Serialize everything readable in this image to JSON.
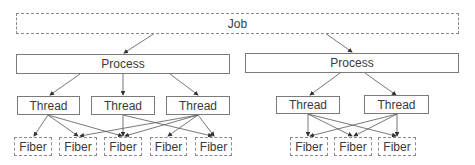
{
  "diagram": {
    "job": {
      "label": "Job"
    },
    "processes": [
      {
        "label": "Process"
      },
      {
        "label": "Process"
      }
    ],
    "threads": [
      {
        "label": "Thread",
        "process": 0
      },
      {
        "label": "Thread",
        "process": 0
      },
      {
        "label": "Thread",
        "process": 0
      },
      {
        "label": "Thread",
        "process": 1
      },
      {
        "label": "Thread",
        "process": 1
      }
    ],
    "fibers": [
      {
        "label": "Fiber",
        "group": 0
      },
      {
        "label": "Fiber",
        "group": 0
      },
      {
        "label": "Fiber",
        "group": 0
      },
      {
        "label": "Fiber",
        "group": 0
      },
      {
        "label": "Fiber",
        "group": 0
      },
      {
        "label": "Fiber",
        "group": 1
      },
      {
        "label": "Fiber",
        "group": 1
      },
      {
        "label": "Fiber",
        "group": 1
      }
    ],
    "edges": {
      "job_to_process": [
        0,
        1
      ],
      "process_to_thread": [
        [
          0,
          0
        ],
        [
          0,
          1
        ],
        [
          0,
          2
        ],
        [
          1,
          3
        ],
        [
          1,
          4
        ]
      ],
      "thread_to_fiber": [
        [
          0,
          0
        ],
        [
          0,
          1
        ],
        [
          0,
          2
        ],
        [
          1,
          2
        ],
        [
          1,
          4
        ],
        [
          2,
          1
        ],
        [
          2,
          2
        ],
        [
          2,
          3
        ],
        [
          2,
          4
        ],
        [
          3,
          5
        ],
        [
          3,
          6
        ],
        [
          3,
          7
        ],
        [
          4,
          5
        ],
        [
          4,
          6
        ],
        [
          4,
          7
        ]
      ]
    },
    "colors": {
      "line": "#555555",
      "solid_border": "#7a7a7a",
      "dashed_border": "#8a8a8a"
    }
  }
}
